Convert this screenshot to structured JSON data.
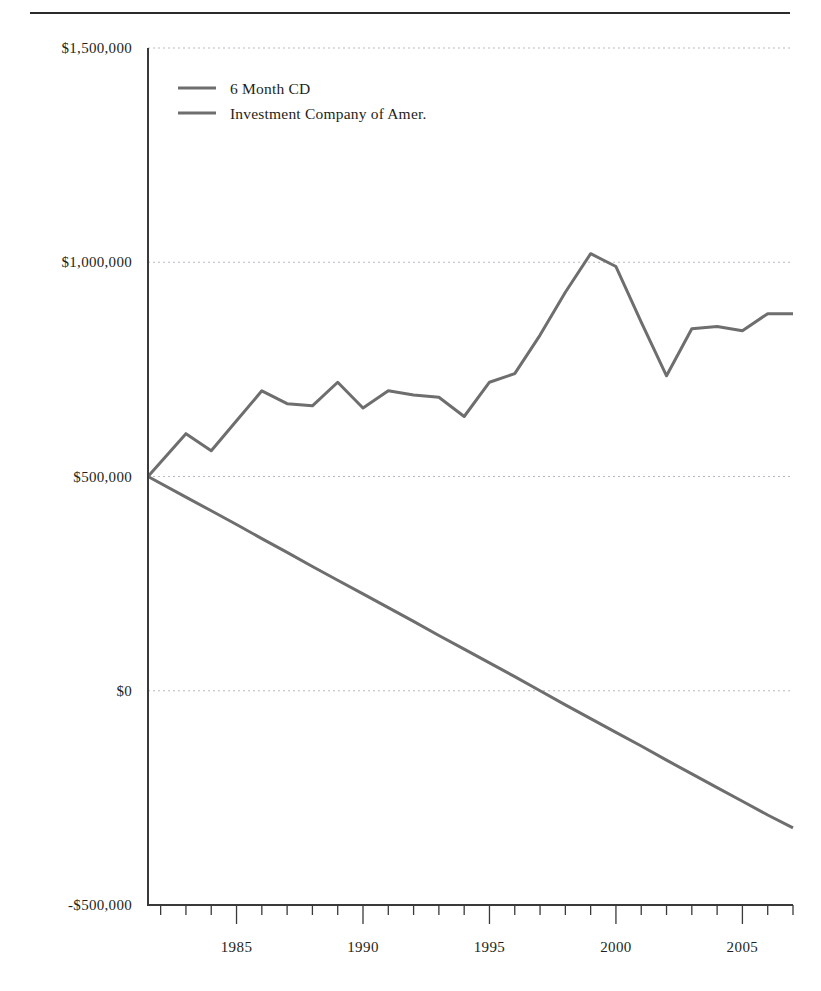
{
  "figure": {
    "background_color": "#ffffff",
    "rule_color": "#2b2b2b",
    "axis_color": "#3a3a3a",
    "grid_color": "#b9b9c4"
  },
  "legend": {
    "position": "top-left-inside",
    "entries": [
      {
        "label": "6 Month CD",
        "color": "#6e6e6e"
      },
      {
        "label": "Investment Company of Amer.",
        "color": "#6e6e6e"
      }
    ]
  },
  "axes": {
    "y_tick_labels": [
      "$1,500,000",
      "$1,000,000",
      "$500,000",
      "$0",
      "-$500,000"
    ],
    "y_tick_values": [
      1500000,
      1000000,
      500000,
      0,
      -500000
    ],
    "x_tick_labels": [
      "1985",
      "1990",
      "1995",
      "2000",
      "2005"
    ],
    "x_tick_values": [
      1985,
      1990,
      1995,
      2000,
      2005
    ],
    "x_minor_tick_interval": 1,
    "x_minor_first": 1982,
    "x_minor_last": 2007
  },
  "chart_data": {
    "type": "line",
    "title": "",
    "xlabel": "",
    "ylabel": "",
    "xlim": [
      1981.5,
      2007.0
    ],
    "ylim": [
      -500000,
      1500000
    ],
    "grid": true,
    "legend_position": "upper left",
    "x": [
      1981.5,
      1983,
      1984,
      1985,
      1986,
      1987,
      1988,
      1989,
      1990,
      1991,
      1992,
      1993,
      1994,
      1995,
      1996,
      1997,
      1998,
      1999,
      2000,
      2001,
      2002,
      2003,
      2004,
      2005,
      2006,
      2007
    ],
    "series": [
      {
        "name": "Investment Company of Amer.",
        "color": "#6e6e6e",
        "values": [
          500000,
          600000,
          560000,
          630000,
          700000,
          670000,
          665000,
          720000,
          660000,
          700000,
          690000,
          685000,
          640000,
          720000,
          740000,
          830000,
          930000,
          1020000,
          990000,
          860000,
          735000,
          845000,
          850000,
          840000,
          880000,
          880000
        ]
      },
      {
        "name": "6 Month CD",
        "color": "#6e6e6e",
        "values": [
          500000,
          452000,
          420000,
          388000,
          355000,
          323000,
          290000,
          258000,
          226000,
          194000,
          162000,
          129000,
          97000,
          65000,
          33000,
          0,
          -33000,
          -65000,
          -97000,
          -129000,
          -162000,
          -194000,
          -226000,
          -258000,
          -290000,
          -320000
        ]
      }
    ],
    "annotations": []
  }
}
